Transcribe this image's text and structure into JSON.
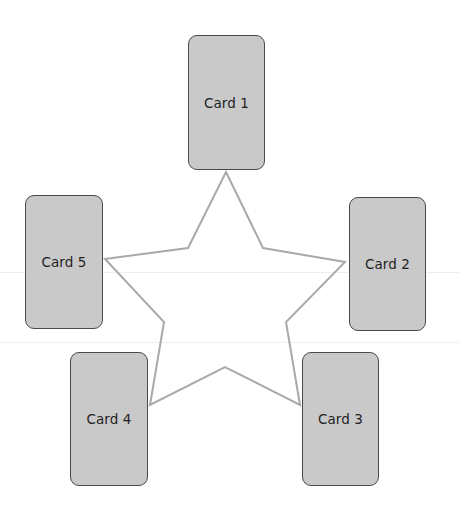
{
  "diagram": {
    "type": "star-card-spread",
    "star": {
      "stroke_color": "#a9a9a9",
      "points": "226,172 263,248 345,262 286,322 300,405 225,367 150,405 164,322 105,259 188,248"
    },
    "colors": {
      "card_fill": "#c9c9c9",
      "card_border": "#4a4a4a",
      "text": "#1f1f1f",
      "background": "#ffffff"
    },
    "cards": [
      {
        "label": "Card 1",
        "x": 188,
        "y": 35,
        "w": 77,
        "h": 135
      },
      {
        "label": "Card 2",
        "x": 349,
        "y": 197,
        "w": 77,
        "h": 134
      },
      {
        "label": "Card 3",
        "x": 302,
        "y": 352,
        "w": 77,
        "h": 134
      },
      {
        "label": "Card 4",
        "x": 70,
        "y": 352,
        "w": 78,
        "h": 134
      },
      {
        "label": "Card 5",
        "x": 25,
        "y": 195,
        "w": 78,
        "h": 134
      }
    ]
  }
}
